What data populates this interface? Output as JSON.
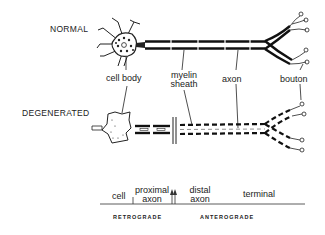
{
  "rows": {
    "normal": "NORMAL",
    "degenerated": "DEGENERATED"
  },
  "labels": {
    "cell_body": "cell body",
    "myelin_sheath_1": "myelin",
    "myelin_sheath_2": "sheath",
    "axon": "axon",
    "bouton": "bouton"
  },
  "scale": {
    "cell": "cell",
    "proximal_1": "proximal",
    "proximal_2": "axon",
    "distal_1": "distal",
    "distal_2": "axon",
    "terminal": "terminal",
    "retrograde": "RETROGRADE",
    "anterograde": "ANTEROGRADE"
  }
}
